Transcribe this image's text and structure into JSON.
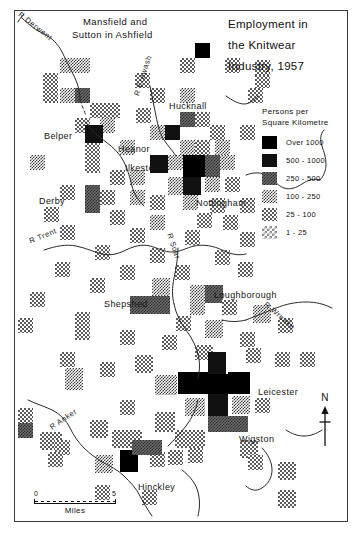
{
  "title": {
    "line1": "Employment in",
    "line2": "the  Knitwear",
    "line3": "Industry,  1957"
  },
  "legend": {
    "heading_line1": "Persons  per",
    "heading_line2": "Square  Kilometre",
    "classes": [
      {
        "label": "Over 1000",
        "density": "d6",
        "color": "#000000"
      },
      {
        "label": "500 - 1000",
        "density": "d5",
        "color": "#111111"
      },
      {
        "label": "250 - 500",
        "density": "d4",
        "color": "#6d6d6d"
      },
      {
        "label": "100 - 250",
        "density": "d3",
        "color": "#3a3a3a"
      },
      {
        "label": "25 - 100",
        "density": "d2",
        "color": "#5a5a5a"
      },
      {
        "label": "1 - 25",
        "density": "d1",
        "color": "#8d8d8d"
      }
    ]
  },
  "places": [
    {
      "name": "Mansfield and",
      "x": 83,
      "y": 15,
      "type": "region"
    },
    {
      "name": "Sutton in Ashfield",
      "x": 72,
      "y": 28,
      "type": "region"
    },
    {
      "name": "Hucknall",
      "x": 169,
      "y": 101,
      "type": "place"
    },
    {
      "name": "Belper",
      "x": 44,
      "y": 131,
      "type": "place"
    },
    {
      "name": "Heanor",
      "x": 118,
      "y": 144,
      "type": "place"
    },
    {
      "name": "Ilkeston",
      "x": 125,
      "y": 163,
      "type": "place"
    },
    {
      "name": "Derby",
      "x": 39,
      "y": 196,
      "type": "place"
    },
    {
      "name": "Nottingham",
      "x": 196,
      "y": 198,
      "type": "place"
    },
    {
      "name": "Shepshed",
      "x": 104,
      "y": 299,
      "type": "place"
    },
    {
      "name": "Loughborough",
      "x": 214,
      "y": 290,
      "type": "place"
    },
    {
      "name": "Leicester",
      "x": 258,
      "y": 387,
      "type": "place"
    },
    {
      "name": "Wigston",
      "x": 239,
      "y": 434,
      "type": "place"
    },
    {
      "name": "Hinckley",
      "x": 138,
      "y": 482,
      "type": "place"
    }
  ],
  "rivers": [
    {
      "name": "R Derwent",
      "x": 22,
      "y": 10,
      "rot": 38
    },
    {
      "name": "R Erewash",
      "x": 132,
      "y": 94,
      "rot": -72
    },
    {
      "name": "R Trent",
      "x": 28,
      "y": 237,
      "rot": -22
    },
    {
      "name": "R Soar",
      "x": 174,
      "y": 232,
      "rot": 72
    },
    {
      "name": "R Wreake",
      "x": 268,
      "y": 300,
      "rot": 40
    },
    {
      "name": "R Anker",
      "x": 48,
      "y": 424,
      "rot": -34
    }
  ],
  "scale": {
    "start": "0",
    "end": "5",
    "units": "Miles"
  },
  "north": {
    "label": "N"
  },
  "chart_data": {
    "type": "heatmap",
    "title": "Employment in the Knitwear Industry, 1957",
    "xlabel": "",
    "ylabel": "",
    "value_unit": "Persons per Square Kilometre",
    "cell_size_px": 15,
    "class_breaks": [
      "1 - 25",
      "25 - 100",
      "100 - 250",
      "250 - 500",
      "500 - 1000",
      "Over 1000"
    ],
    "cells": [
      {
        "x": 60,
        "y": 58,
        "w": 30,
        "h": 15,
        "c": 3
      },
      {
        "x": 180,
        "y": 58,
        "w": 15,
        "h": 15,
        "c": 2
      },
      {
        "x": 225,
        "y": 58,
        "w": 15,
        "h": 15,
        "c": 2
      },
      {
        "x": 195,
        "y": 43,
        "w": 15,
        "h": 15,
        "c": 6
      },
      {
        "x": 255,
        "y": 73,
        "w": 15,
        "h": 15,
        "c": 2
      },
      {
        "x": 43,
        "y": 73,
        "w": 15,
        "h": 30,
        "c": 2
      },
      {
        "x": 60,
        "y": 88,
        "w": 15,
        "h": 15,
        "c": 3
      },
      {
        "x": 75,
        "y": 88,
        "w": 15,
        "h": 15,
        "c": 4
      },
      {
        "x": 135,
        "y": 73,
        "w": 15,
        "h": 15,
        "c": 2
      },
      {
        "x": 150,
        "y": 88,
        "w": 15,
        "h": 15,
        "c": 2
      },
      {
        "x": 180,
        "y": 88,
        "w": 15,
        "h": 15,
        "c": 3
      },
      {
        "x": 90,
        "y": 103,
        "w": 30,
        "h": 15,
        "c": 2
      },
      {
        "x": 136,
        "y": 108,
        "w": 15,
        "h": 15,
        "c": 2
      },
      {
        "x": 180,
        "y": 112,
        "w": 15,
        "h": 15,
        "c": 4
      },
      {
        "x": 195,
        "y": 112,
        "w": 15,
        "h": 15,
        "c": 2
      },
      {
        "x": 100,
        "y": 118,
        "w": 15,
        "h": 15,
        "c": 3
      },
      {
        "x": 75,
        "y": 118,
        "w": 15,
        "h": 15,
        "c": 2
      },
      {
        "x": 150,
        "y": 125,
        "w": 15,
        "h": 15,
        "c": 3
      },
      {
        "x": 165,
        "y": 125,
        "w": 15,
        "h": 15,
        "c": 5
      },
      {
        "x": 210,
        "y": 125,
        "w": 15,
        "h": 15,
        "c": 2
      },
      {
        "x": 240,
        "y": 125,
        "w": 15,
        "h": 15,
        "c": 2
      },
      {
        "x": 85,
        "y": 125,
        "w": 18,
        "h": 18,
        "c": 5
      },
      {
        "x": 85,
        "y": 143,
        "w": 15,
        "h": 30,
        "c": 2
      },
      {
        "x": 120,
        "y": 140,
        "w": 15,
        "h": 15,
        "c": 3
      },
      {
        "x": 180,
        "y": 140,
        "w": 15,
        "h": 15,
        "c": 3
      },
      {
        "x": 195,
        "y": 140,
        "w": 15,
        "h": 15,
        "c": 2
      },
      {
        "x": 215,
        "y": 140,
        "w": 15,
        "h": 15,
        "c": 3
      },
      {
        "x": 150,
        "y": 155,
        "w": 18,
        "h": 18,
        "c": 5
      },
      {
        "x": 168,
        "y": 155,
        "w": 15,
        "h": 15,
        "c": 3
      },
      {
        "x": 183,
        "y": 155,
        "w": 22,
        "h": 22,
        "c": 6
      },
      {
        "x": 205,
        "y": 155,
        "w": 15,
        "h": 22,
        "c": 4
      },
      {
        "x": 220,
        "y": 155,
        "w": 15,
        "h": 15,
        "c": 3
      },
      {
        "x": 30,
        "y": 155,
        "w": 15,
        "h": 15,
        "c": 3
      },
      {
        "x": 110,
        "y": 170,
        "w": 15,
        "h": 15,
        "c": 2
      },
      {
        "x": 130,
        "y": 170,
        "w": 15,
        "h": 15,
        "c": 3
      },
      {
        "x": 168,
        "y": 177,
        "w": 15,
        "h": 18,
        "c": 3
      },
      {
        "x": 183,
        "y": 177,
        "w": 18,
        "h": 18,
        "c": 5
      },
      {
        "x": 205,
        "y": 177,
        "w": 15,
        "h": 15,
        "c": 3
      },
      {
        "x": 225,
        "y": 177,
        "w": 15,
        "h": 15,
        "c": 2
      },
      {
        "x": 60,
        "y": 185,
        "w": 15,
        "h": 15,
        "c": 2
      },
      {
        "x": 85,
        "y": 185,
        "w": 15,
        "h": 28,
        "c": 4
      },
      {
        "x": 100,
        "y": 190,
        "w": 15,
        "h": 15,
        "c": 2
      },
      {
        "x": 130,
        "y": 190,
        "w": 15,
        "h": 15,
        "c": 3
      },
      {
        "x": 150,
        "y": 195,
        "w": 15,
        "h": 15,
        "c": 2
      },
      {
        "x": 183,
        "y": 195,
        "w": 15,
        "h": 15,
        "c": 3
      },
      {
        "x": 210,
        "y": 198,
        "w": 15,
        "h": 15,
        "c": 2
      },
      {
        "x": 240,
        "y": 198,
        "w": 15,
        "h": 15,
        "c": 2
      },
      {
        "x": 44,
        "y": 207,
        "w": 15,
        "h": 15,
        "c": 2
      },
      {
        "x": 110,
        "y": 210,
        "w": 15,
        "h": 15,
        "c": 2
      },
      {
        "x": 150,
        "y": 215,
        "w": 15,
        "h": 15,
        "c": 3
      },
      {
        "x": 197,
        "y": 213,
        "w": 15,
        "h": 15,
        "c": 2
      },
      {
        "x": 223,
        "y": 215,
        "w": 15,
        "h": 15,
        "c": 2
      },
      {
        "x": 60,
        "y": 225,
        "w": 15,
        "h": 15,
        "c": 2
      },
      {
        "x": 130,
        "y": 228,
        "w": 15,
        "h": 15,
        "c": 2
      },
      {
        "x": 185,
        "y": 230,
        "w": 15,
        "h": 15,
        "c": 2
      },
      {
        "x": 240,
        "y": 232,
        "w": 15,
        "h": 15,
        "c": 2
      },
      {
        "x": 95,
        "y": 245,
        "w": 15,
        "h": 15,
        "c": 2
      },
      {
        "x": 150,
        "y": 248,
        "w": 15,
        "h": 15,
        "c": 2
      },
      {
        "x": 215,
        "y": 250,
        "w": 15,
        "h": 15,
        "c": 2
      },
      {
        "x": 55,
        "y": 262,
        "w": 15,
        "h": 15,
        "c": 2
      },
      {
        "x": 120,
        "y": 265,
        "w": 15,
        "h": 15,
        "c": 2
      },
      {
        "x": 175,
        "y": 265,
        "w": 15,
        "h": 15,
        "c": 2
      },
      {
        "x": 238,
        "y": 262,
        "w": 15,
        "h": 15,
        "c": 2
      },
      {
        "x": 90,
        "y": 278,
        "w": 15,
        "h": 15,
        "c": 2
      },
      {
        "x": 152,
        "y": 278,
        "w": 18,
        "h": 18,
        "c": 3
      },
      {
        "x": 190,
        "y": 285,
        "w": 15,
        "h": 15,
        "c": 3
      },
      {
        "x": 205,
        "y": 285,
        "w": 18,
        "h": 18,
        "c": 4
      },
      {
        "x": 30,
        "y": 292,
        "w": 15,
        "h": 15,
        "c": 2
      },
      {
        "x": 130,
        "y": 296,
        "w": 18,
        "h": 18,
        "c": 4
      },
      {
        "x": 148,
        "y": 296,
        "w": 22,
        "h": 18,
        "c": 4
      },
      {
        "x": 190,
        "y": 300,
        "w": 15,
        "h": 15,
        "c": 3
      },
      {
        "x": 222,
        "y": 300,
        "w": 15,
        "h": 15,
        "c": 2
      },
      {
        "x": 18,
        "y": 318,
        "w": 15,
        "h": 15,
        "c": 2
      },
      {
        "x": 75,
        "y": 312,
        "w": 15,
        "h": 28,
        "c": 2
      },
      {
        "x": 176,
        "y": 316,
        "w": 15,
        "h": 15,
        "c": 2
      },
      {
        "x": 253,
        "y": 305,
        "w": 18,
        "h": 18,
        "c": 3
      },
      {
        "x": 205,
        "y": 320,
        "w": 18,
        "h": 18,
        "c": 3
      },
      {
        "x": 120,
        "y": 330,
        "w": 15,
        "h": 15,
        "c": 2
      },
      {
        "x": 162,
        "y": 335,
        "w": 15,
        "h": 15,
        "c": 2
      },
      {
        "x": 240,
        "y": 332,
        "w": 15,
        "h": 15,
        "c": 2
      },
      {
        "x": 195,
        "y": 345,
        "w": 18,
        "h": 15,
        "c": 2
      },
      {
        "x": 60,
        "y": 352,
        "w": 15,
        "h": 15,
        "c": 2
      },
      {
        "x": 135,
        "y": 355,
        "w": 18,
        "h": 18,
        "c": 2
      },
      {
        "x": 208,
        "y": 352,
        "w": 18,
        "h": 22,
        "c": 5
      },
      {
        "x": 246,
        "y": 348,
        "w": 15,
        "h": 15,
        "c": 2
      },
      {
        "x": 100,
        "y": 362,
        "w": 15,
        "h": 15,
        "c": 2
      },
      {
        "x": 65,
        "y": 368,
        "w": 18,
        "h": 22,
        "c": 3
      },
      {
        "x": 178,
        "y": 372,
        "w": 30,
        "h": 22,
        "c": 6
      },
      {
        "x": 208,
        "y": 374,
        "w": 20,
        "h": 20,
        "c": 6
      },
      {
        "x": 228,
        "y": 372,
        "w": 22,
        "h": 22,
        "c": 6
      },
      {
        "x": 155,
        "y": 375,
        "w": 22,
        "h": 20,
        "c": 3
      },
      {
        "x": 208,
        "y": 394,
        "w": 20,
        "h": 22,
        "c": 5
      },
      {
        "x": 232,
        "y": 396,
        "w": 18,
        "h": 18,
        "c": 3
      },
      {
        "x": 185,
        "y": 398,
        "w": 20,
        "h": 18,
        "c": 3
      },
      {
        "x": 120,
        "y": 400,
        "w": 15,
        "h": 15,
        "c": 2
      },
      {
        "x": 255,
        "y": 398,
        "w": 15,
        "h": 15,
        "c": 2
      },
      {
        "x": 208,
        "y": 416,
        "w": 20,
        "h": 16,
        "c": 4
      },
      {
        "x": 228,
        "y": 416,
        "w": 20,
        "h": 16,
        "c": 4
      },
      {
        "x": 155,
        "y": 412,
        "w": 20,
        "h": 20,
        "c": 2
      },
      {
        "x": 18,
        "y": 408,
        "w": 15,
        "h": 15,
        "c": 2
      },
      {
        "x": 18,
        "y": 423,
        "w": 15,
        "h": 15,
        "c": 4
      },
      {
        "x": 90,
        "y": 420,
        "w": 18,
        "h": 18,
        "c": 2
      },
      {
        "x": 175,
        "y": 430,
        "w": 30,
        "h": 18,
        "c": 2
      },
      {
        "x": 112,
        "y": 430,
        "w": 30,
        "h": 18,
        "c": 2
      },
      {
        "x": 40,
        "y": 432,
        "w": 22,
        "h": 18,
        "c": 2
      },
      {
        "x": 55,
        "y": 440,
        "w": 15,
        "h": 15,
        "c": 2
      },
      {
        "x": 240,
        "y": 440,
        "w": 18,
        "h": 18,
        "c": 2
      },
      {
        "x": 300,
        "y": 352,
        "w": 15,
        "h": 15,
        "c": 2
      },
      {
        "x": 275,
        "y": 352,
        "w": 15,
        "h": 15,
        "c": 2
      },
      {
        "x": 278,
        "y": 318,
        "w": 15,
        "h": 15,
        "c": 2
      },
      {
        "x": 48,
        "y": 452,
        "w": 15,
        "h": 15,
        "c": 2
      },
      {
        "x": 150,
        "y": 452,
        "w": 15,
        "h": 15,
        "c": 2
      },
      {
        "x": 95,
        "y": 455,
        "w": 18,
        "h": 18,
        "c": 3
      },
      {
        "x": 120,
        "y": 450,
        "w": 18,
        "h": 22,
        "c": 6
      },
      {
        "x": 132,
        "y": 440,
        "w": 30,
        "h": 15,
        "c": 4
      },
      {
        "x": 168,
        "y": 450,
        "w": 15,
        "h": 15,
        "c": 2
      },
      {
        "x": 188,
        "y": 448,
        "w": 15,
        "h": 15,
        "c": 2
      },
      {
        "x": 248,
        "y": 455,
        "w": 15,
        "h": 15,
        "c": 2
      },
      {
        "x": 278,
        "y": 462,
        "w": 18,
        "h": 18,
        "c": 2
      },
      {
        "x": 95,
        "y": 485,
        "w": 15,
        "h": 15,
        "c": 2
      },
      {
        "x": 142,
        "y": 490,
        "w": 15,
        "h": 15,
        "c": 2
      },
      {
        "x": 278,
        "y": 490,
        "w": 18,
        "h": 18,
        "c": 2
      },
      {
        "x": 255,
        "y": 60,
        "w": 15,
        "h": 15,
        "c": 2
      },
      {
        "x": 248,
        "y": 88,
        "w": 15,
        "h": 15,
        "c": 2
      }
    ]
  }
}
